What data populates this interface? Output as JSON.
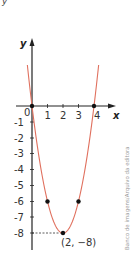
{
  "top_fragment": "y",
  "credit": "Banco de imagens/Arquivo da editora",
  "chart_data": {
    "type": "line",
    "title": "",
    "function": "y = 2x^2 - 8x",
    "xlabel": "x",
    "ylabel": "y",
    "x_ticks": [
      "0",
      "1",
      "2",
      "3",
      "4"
    ],
    "y_ticks": [
      "-1",
      "-2",
      "-3",
      "-4",
      "-5",
      "-6",
      "-7",
      "-8"
    ],
    "xlim": [
      -0.3,
      4.3
    ],
    "ylim": [
      -9,
      4
    ],
    "grid": false,
    "curve_color": "#e0705e",
    "points": [
      {
        "x": 0,
        "y": 0
      },
      {
        "x": 1,
        "y": -6
      },
      {
        "x": 2,
        "y": -8
      },
      {
        "x": 3,
        "y": -6
      },
      {
        "x": 4,
        "y": 0
      }
    ],
    "annotations": [
      {
        "text": "(2, −8)",
        "x": 2,
        "y": -8
      }
    ]
  }
}
